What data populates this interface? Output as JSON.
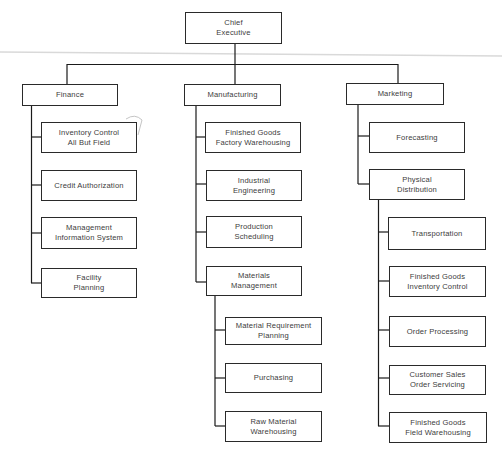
{
  "org_chart": {
    "root": {
      "label": "Chief\nExecutive"
    },
    "departments": [
      {
        "label": "Finance",
        "children": [
          {
            "label": "Inventory Control\nAll But Field"
          },
          {
            "label": "Credit  Authorization"
          },
          {
            "label": "Management\nInformation System"
          },
          {
            "label": "Facility\nPlanning"
          }
        ]
      },
      {
        "label": "Manufacturing",
        "children": [
          {
            "label": "Finished Goods\nFactory Warehousing"
          },
          {
            "label": "Industrial\nEngineering"
          },
          {
            "label": "Production\nScheduling"
          },
          {
            "label": "Materials\nManagement",
            "children": [
              {
                "label": "Material Requirement\nPlanning"
              },
              {
                "label": "Purchasing"
              },
              {
                "label": "Raw Material\nWarehousing"
              }
            ]
          }
        ]
      },
      {
        "label": "Marketing",
        "children": [
          {
            "label": "Forecasting"
          },
          {
            "label": "Physical\nDistribution",
            "children": [
              {
                "label": "Transportation"
              },
              {
                "label": "Finished Goods\nInventory Control"
              },
              {
                "label": "Order Processing"
              },
              {
                "label": "Customer Sales\nOrder Servicing"
              },
              {
                "label": "Finished Goods\nField Warehousing"
              }
            ]
          }
        ]
      }
    ],
    "annotation": {
      "pencil_mark": "handwritten curve near Inventory Control box"
    },
    "colors": {
      "line": "#1a1a1a",
      "text": "#3c3c3c",
      "scan_artifact": "#d9d9d9"
    }
  }
}
